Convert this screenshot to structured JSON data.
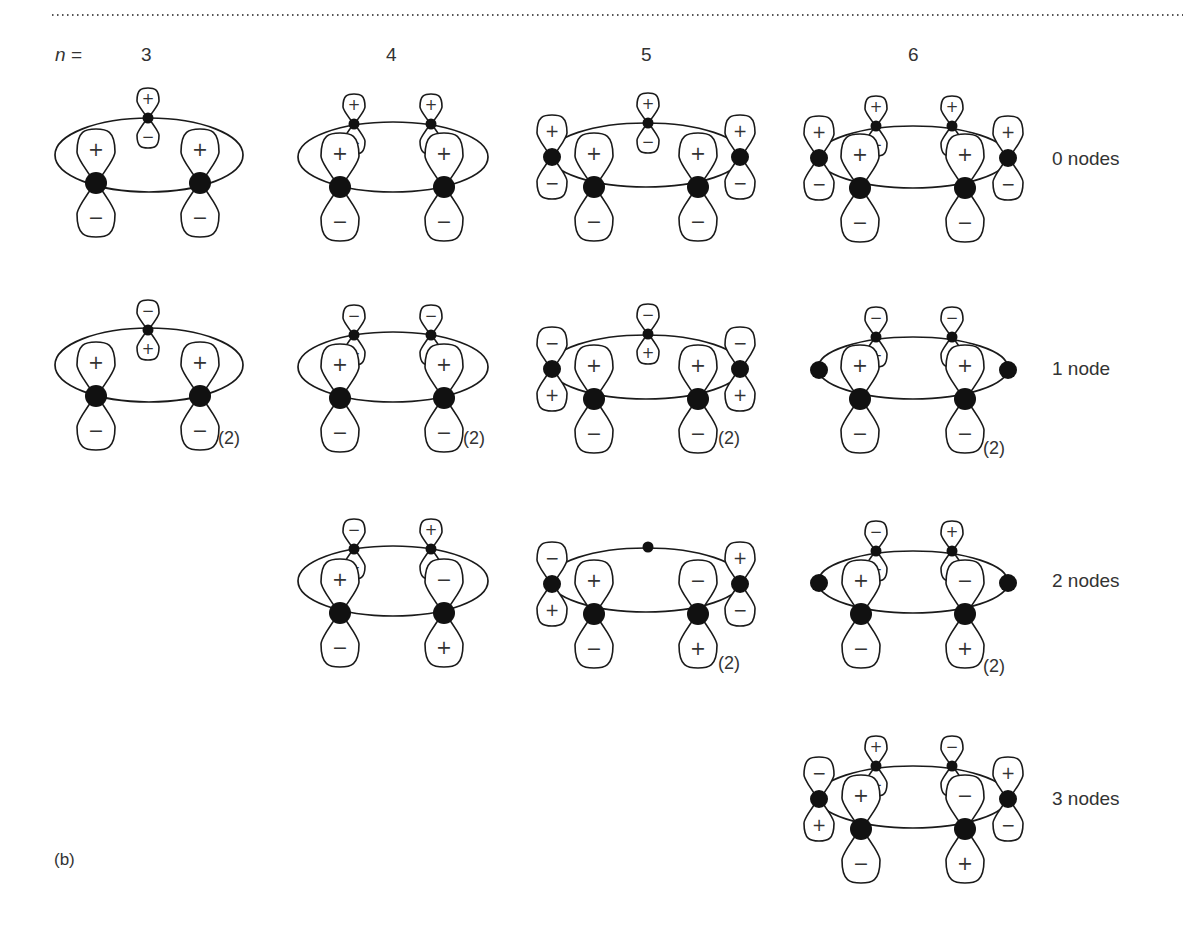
{
  "figure": {
    "panel_label": "(b)",
    "n_label": "n =",
    "columns": [
      {
        "n": "3",
        "x": 148
      },
      {
        "n": "4",
        "x": 393
      },
      {
        "n": "5",
        "x": 648
      },
      {
        "n": "6",
        "x": 915
      }
    ],
    "row_labels": [
      {
        "text": "0 nodes",
        "y": 160
      },
      {
        "text": "1 node",
        "y": 370
      },
      {
        "text": "2 nodes",
        "y": 582
      },
      {
        "text": "3 nodes",
        "y": 800
      }
    ],
    "degeneracy_label": "(2)",
    "colors": {
      "line": "#1a1a1a",
      "atom": "#111111",
      "text": "#333333",
      "dots": "#555555"
    }
  },
  "diagrams": [
    {
      "row": 0,
      "n": 3,
      "ellipse": [
        149,
        155,
        94,
        37
      ],
      "degenerate": false,
      "atoms": [
        {
          "x": 148,
          "y": 118,
          "size": "s",
          "top": "+",
          "bottom": "−"
        },
        {
          "x": 96,
          "y": 183,
          "size": "l",
          "top": "+",
          "bottom": "−"
        },
        {
          "x": 200,
          "y": 183,
          "size": "l",
          "top": "+",
          "bottom": "−"
        }
      ]
    },
    {
      "row": 0,
      "n": 4,
      "ellipse": [
        393,
        157,
        95,
        35
      ],
      "degenerate": false,
      "atoms": [
        {
          "x": 354,
          "y": 124,
          "size": "s",
          "top": "+",
          "bottom": "−"
        },
        {
          "x": 431,
          "y": 124,
          "size": "s",
          "top": "+",
          "bottom": "−"
        },
        {
          "x": 340,
          "y": 187,
          "size": "l",
          "top": "+",
          "bottom": "−"
        },
        {
          "x": 444,
          "y": 187,
          "size": "l",
          "top": "+",
          "bottom": "−"
        }
      ]
    },
    {
      "row": 0,
      "n": 5,
      "ellipse": [
        646,
        155,
        96,
        32
      ],
      "degenerate": false,
      "atoms": [
        {
          "x": 648,
          "y": 123,
          "size": "s",
          "top": "+",
          "bottom": "−"
        },
        {
          "x": 552,
          "y": 157,
          "size": "m",
          "top": "+",
          "bottom": "−"
        },
        {
          "x": 740,
          "y": 157,
          "size": "m",
          "top": "+",
          "bottom": "−"
        },
        {
          "x": 594,
          "y": 187,
          "size": "l",
          "top": "+",
          "bottom": "−"
        },
        {
          "x": 698,
          "y": 187,
          "size": "l",
          "top": "+",
          "bottom": "−"
        }
      ]
    },
    {
      "row": 0,
      "n": 6,
      "ellipse": [
        913,
        157,
        95,
        31
      ],
      "degenerate": false,
      "atoms": [
        {
          "x": 876,
          "y": 126,
          "size": "s",
          "top": "+",
          "bottom": "−"
        },
        {
          "x": 952,
          "y": 126,
          "size": "s",
          "top": "+",
          "bottom": "−"
        },
        {
          "x": 819,
          "y": 158,
          "size": "m",
          "top": "+",
          "bottom": "−"
        },
        {
          "x": 1008,
          "y": 158,
          "size": "m",
          "top": "+",
          "bottom": "−"
        },
        {
          "x": 860,
          "y": 188,
          "size": "l",
          "top": "+",
          "bottom": "−"
        },
        {
          "x": 965,
          "y": 188,
          "size": "l",
          "top": "+",
          "bottom": "−"
        }
      ]
    },
    {
      "row": 1,
      "n": 3,
      "ellipse": [
        149,
        365,
        94,
        37
      ],
      "degenerate": true,
      "deg_pos": [
        220,
        440
      ],
      "atoms": [
        {
          "x": 148,
          "y": 330,
          "size": "s",
          "top": "−",
          "bottom": "+"
        },
        {
          "x": 96,
          "y": 396,
          "size": "l",
          "top": "+",
          "bottom": "−"
        },
        {
          "x": 200,
          "y": 396,
          "size": "l",
          "top": "+",
          "bottom": "−"
        }
      ]
    },
    {
      "row": 1,
      "n": 4,
      "ellipse": [
        393,
        367,
        95,
        35
      ],
      "degenerate": true,
      "deg_pos": [
        465,
        440
      ],
      "atoms": [
        {
          "x": 354,
          "y": 335,
          "size": "s",
          "top": "−",
          "bottom": "+"
        },
        {
          "x": 431,
          "y": 335,
          "size": "s",
          "top": "−",
          "bottom": "+"
        },
        {
          "x": 340,
          "y": 398,
          "size": "l",
          "top": "+",
          "bottom": "−"
        },
        {
          "x": 444,
          "y": 398,
          "size": "l",
          "top": "+",
          "bottom": "−"
        }
      ]
    },
    {
      "row": 1,
      "n": 5,
      "ellipse": [
        646,
        367,
        96,
        32
      ],
      "degenerate": true,
      "deg_pos": [
        720,
        440
      ],
      "atoms": [
        {
          "x": 648,
          "y": 334,
          "size": "s",
          "top": "−",
          "bottom": "+"
        },
        {
          "x": 552,
          "y": 369,
          "size": "m",
          "top": "−",
          "bottom": "+"
        },
        {
          "x": 740,
          "y": 369,
          "size": "m",
          "top": "−",
          "bottom": "+"
        },
        {
          "x": 594,
          "y": 399,
          "size": "l",
          "top": "+",
          "bottom": "−"
        },
        {
          "x": 698,
          "y": 399,
          "size": "l",
          "top": "+",
          "bottom": "−"
        }
      ]
    },
    {
      "row": 1,
      "n": 6,
      "ellipse": [
        913,
        368,
        95,
        31
      ],
      "degenerate": true,
      "deg_pos": [
        985,
        450
      ],
      "atoms": [
        {
          "x": 876,
          "y": 337,
          "size": "s",
          "top": "−",
          "bottom": "+"
        },
        {
          "x": 952,
          "y": 337,
          "size": "s",
          "top": "−",
          "bottom": "+"
        },
        {
          "x": 819,
          "y": 370,
          "size": "m",
          "top": null,
          "bottom": null
        },
        {
          "x": 1008,
          "y": 370,
          "size": "m",
          "top": null,
          "bottom": null
        },
        {
          "x": 860,
          "y": 399,
          "size": "l",
          "top": "+",
          "bottom": "−"
        },
        {
          "x": 965,
          "y": 399,
          "size": "l",
          "top": "+",
          "bottom": "−"
        }
      ]
    },
    {
      "row": 2,
      "n": 4,
      "ellipse": [
        393,
        581,
        95,
        35
      ],
      "degenerate": false,
      "atoms": [
        {
          "x": 354,
          "y": 549,
          "size": "s",
          "top": "−",
          "bottom": "+"
        },
        {
          "x": 431,
          "y": 549,
          "size": "s",
          "top": "+",
          "bottom": "−"
        },
        {
          "x": 340,
          "y": 613,
          "size": "l",
          "top": "+",
          "bottom": "−"
        },
        {
          "x": 444,
          "y": 613,
          "size": "l",
          "top": "−",
          "bottom": "+"
        }
      ]
    },
    {
      "row": 2,
      "n": 5,
      "ellipse": [
        646,
        580,
        96,
        32
      ],
      "degenerate": true,
      "deg_pos": [
        720,
        665
      ],
      "atoms": [
        {
          "x": 648,
          "y": 547,
          "size": "s",
          "top": null,
          "bottom": null
        },
        {
          "x": 552,
          "y": 584,
          "size": "m",
          "top": "−",
          "bottom": "+"
        },
        {
          "x": 740,
          "y": 584,
          "size": "m",
          "top": "+",
          "bottom": "−"
        },
        {
          "x": 594,
          "y": 614,
          "size": "l",
          "top": "+",
          "bottom": "−"
        },
        {
          "x": 698,
          "y": 614,
          "size": "l",
          "top": "−",
          "bottom": "+"
        }
      ]
    },
    {
      "row": 2,
      "n": 6,
      "ellipse": [
        913,
        582,
        95,
        31
      ],
      "degenerate": true,
      "deg_pos": [
        985,
        668
      ],
      "atoms": [
        {
          "x": 876,
          "y": 551,
          "size": "s",
          "top": "−",
          "bottom": "+"
        },
        {
          "x": 952,
          "y": 551,
          "size": "s",
          "top": "+",
          "bottom": "−"
        },
        {
          "x": 819,
          "y": 583,
          "size": "m",
          "top": null,
          "bottom": null
        },
        {
          "x": 1008,
          "y": 583,
          "size": "m",
          "top": null,
          "bottom": null
        },
        {
          "x": 861,
          "y": 614,
          "size": "l",
          "top": "+",
          "bottom": "−"
        },
        {
          "x": 965,
          "y": 614,
          "size": "l",
          "top": "−",
          "bottom": "+"
        }
      ]
    },
    {
      "row": 3,
      "n": 6,
      "ellipse": [
        913,
        797,
        95,
        31
      ],
      "degenerate": false,
      "atoms": [
        {
          "x": 876,
          "y": 766,
          "size": "s",
          "top": "+",
          "bottom": "−"
        },
        {
          "x": 952,
          "y": 766,
          "size": "s",
          "top": "−",
          "bottom": "+"
        },
        {
          "x": 819,
          "y": 799,
          "size": "m",
          "top": "−",
          "bottom": "+"
        },
        {
          "x": 1008,
          "y": 799,
          "size": "m",
          "top": "+",
          "bottom": "−"
        },
        {
          "x": 861,
          "y": 829,
          "size": "l",
          "top": "+",
          "bottom": "−"
        },
        {
          "x": 965,
          "y": 829,
          "size": "l",
          "top": "−",
          "bottom": "+"
        }
      ]
    }
  ]
}
